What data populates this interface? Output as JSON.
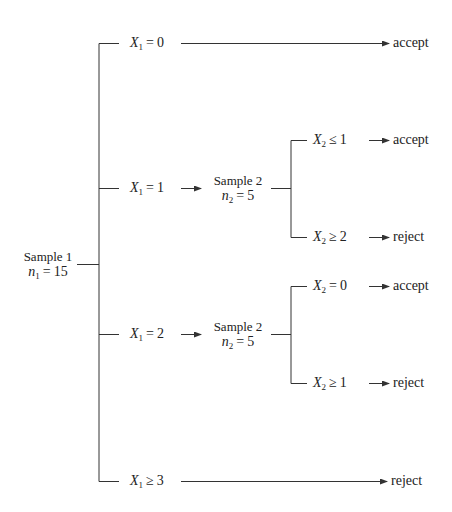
{
  "root": {
    "title": "Sample 1",
    "size_var": "n",
    "size_sub": "1",
    "size_val": "15"
  },
  "branches": [
    {
      "var": "X",
      "sub": "1",
      "op": "=",
      "val": "0",
      "outcome": "accept"
    },
    {
      "var": "X",
      "sub": "1",
      "op": "=",
      "val": "1",
      "next": {
        "title": "Sample 2",
        "size_var": "n",
        "size_sub": "2",
        "size_val": "5",
        "branches": [
          {
            "var": "X",
            "sub": "2",
            "op": "≤",
            "val": "1",
            "outcome": "accept"
          },
          {
            "var": "X",
            "sub": "2",
            "op": "≥",
            "val": "2",
            "outcome": "reject"
          }
        ]
      }
    },
    {
      "var": "X",
      "sub": "1",
      "op": "=",
      "val": "2",
      "next": {
        "title": "Sample 2",
        "size_var": "n",
        "size_sub": "2",
        "size_val": "5",
        "branches": [
          {
            "var": "X",
            "sub": "2",
            "op": "=",
            "val": "0",
            "outcome": "accept"
          },
          {
            "var": "X",
            "sub": "2",
            "op": "≥",
            "val": "1",
            "outcome": "reject"
          }
        ]
      }
    },
    {
      "var": "X",
      "sub": "1",
      "op": "≥",
      "val": "3",
      "outcome": "reject"
    }
  ],
  "colors": {
    "line": "#333333",
    "text": "#222222",
    "background": "#ffffff"
  }
}
